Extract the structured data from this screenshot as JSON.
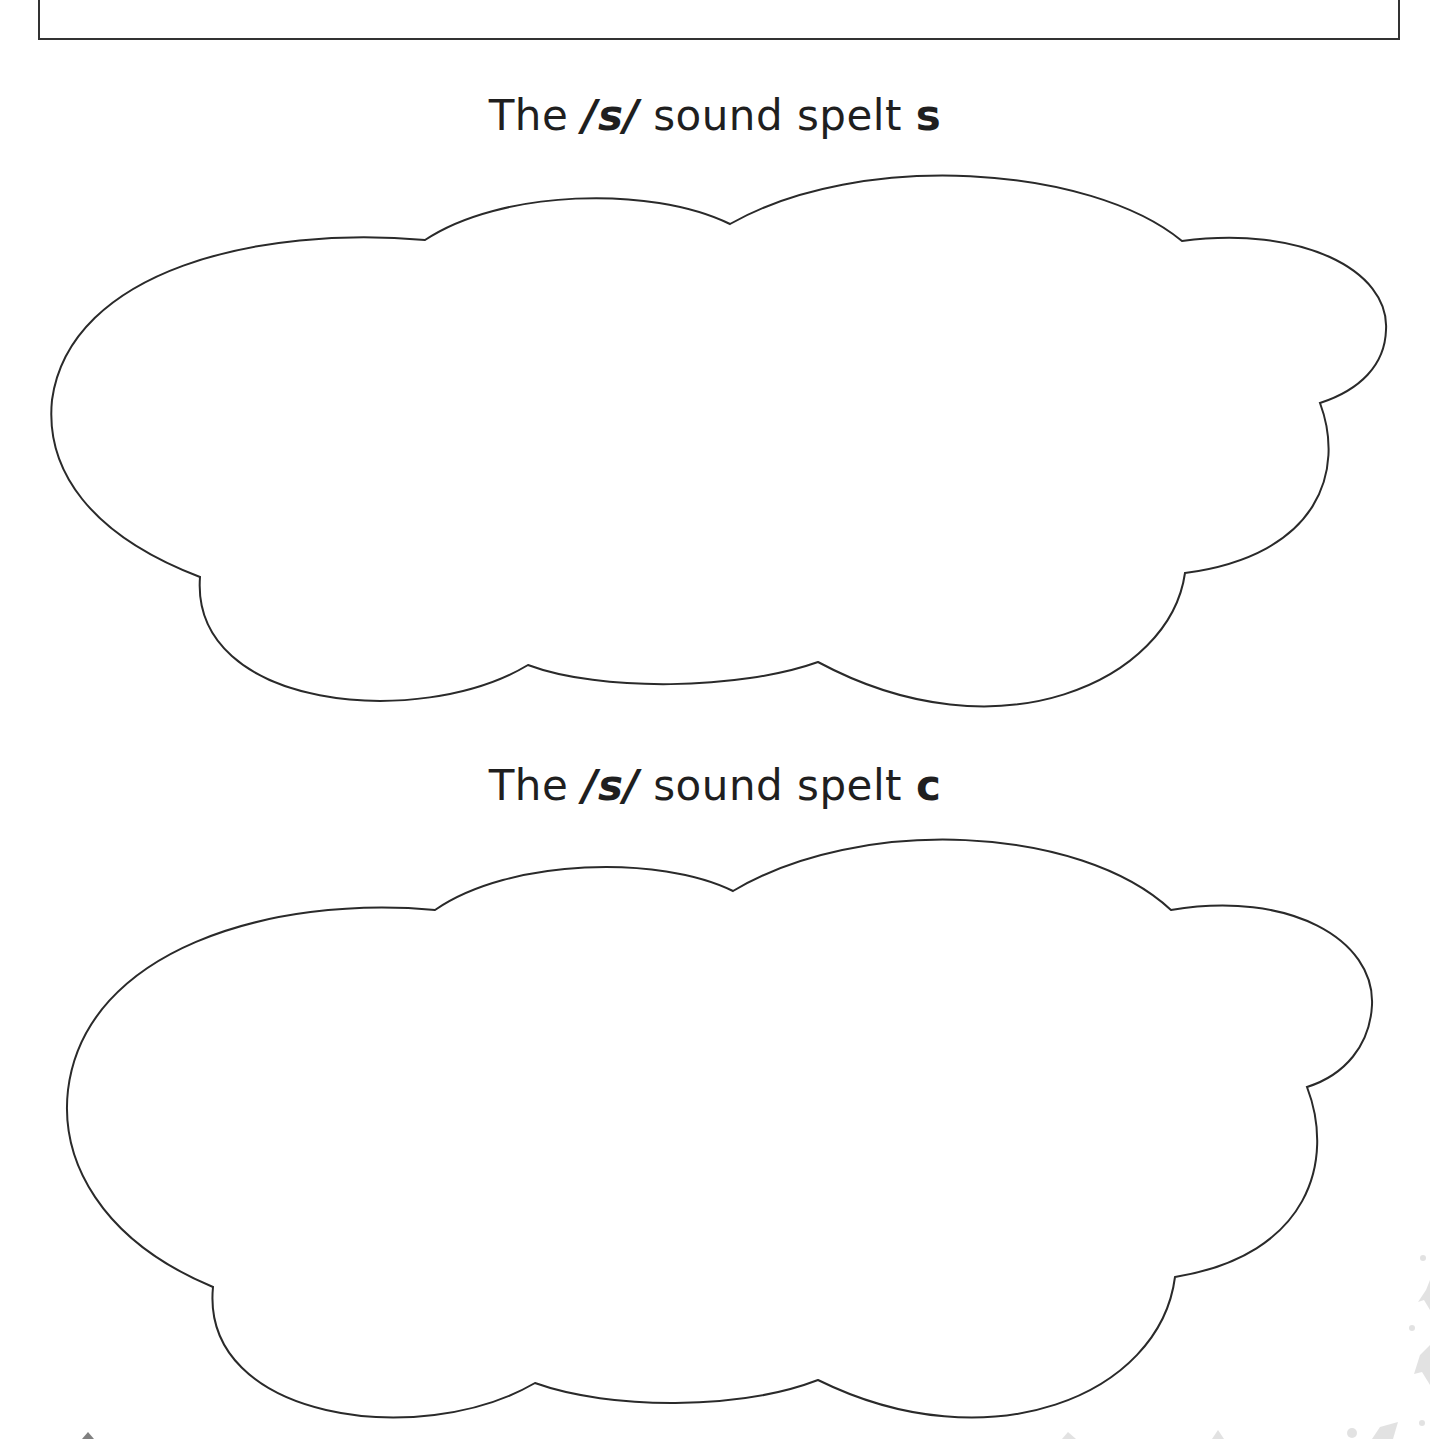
{
  "worksheet": {
    "sections": [
      {
        "prefix": "The ",
        "phoneme": "/s/",
        "middle": " sound spelt ",
        "spelling": "s"
      },
      {
        "prefix": "The ",
        "phoneme": "/s/",
        "middle": " sound spelt ",
        "spelling": "c"
      }
    ],
    "colors": {
      "outline": "#2a2a2a",
      "text": "#1f1f1f",
      "background": "#ffffff",
      "decoration": "#d8d8d8"
    }
  }
}
